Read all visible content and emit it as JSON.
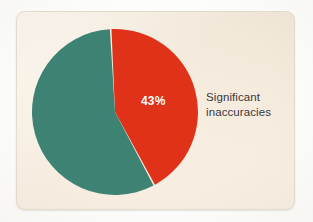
{
  "card": {
    "background_color": "#F7EEE1",
    "border_color": "#E4DCCF"
  },
  "page": {
    "background_color": "#FDFDFB"
  },
  "chart_data": {
    "type": "pie",
    "title": "",
    "subtitle": "",
    "xlabel": "",
    "ylabel": "",
    "grid": false,
    "legend_position": "right-inline",
    "total": 100,
    "units": "%",
    "categories": [
      "Significant inaccuracies",
      "Other"
    ],
    "values": [
      43,
      57
    ],
    "labels": [
      "43%",
      ""
    ],
    "colors": [
      "#E03218",
      "#3D8273"
    ],
    "start_angle_deg": 357,
    "direction": "clockwise",
    "slice_gap": true,
    "slice_gap_color": "#F7EEE1",
    "annotations": [
      {
        "text": "43%",
        "slice": "Significant inaccuracies",
        "color": "#FFFFFF",
        "position": "inside"
      },
      {
        "text": "Significant inaccuracies",
        "color": "#39383A",
        "position": "right-of-chart",
        "lines": [
          "Significant",
          "inaccuracies"
        ]
      }
    ],
    "slices": [
      {
        "name": "Significant inaccuracies",
        "value": 43,
        "label": "43%",
        "color": "#E03218",
        "label_color": "#FFFFFF"
      },
      {
        "name": "Other",
        "value": 57,
        "label": "",
        "color": "#3D8273",
        "label_color": "#FFFFFF"
      }
    ]
  },
  "label": {
    "line1": "Significant",
    "line2": "inaccuracies",
    "color": "#39383A"
  },
  "value_label": {
    "text": "43%",
    "color": "#FFFFFF"
  }
}
